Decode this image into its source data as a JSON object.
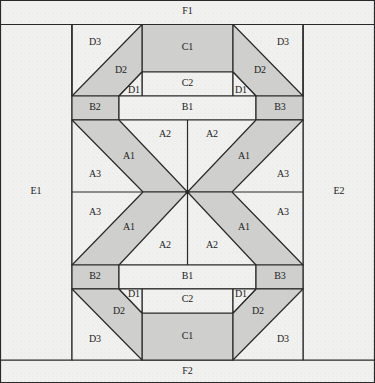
{
  "diagram": {
    "type": "quilt-block-piecing-diagram",
    "colors": {
      "light": "#f1f1ef",
      "shaded": "#cfcfcd",
      "line": "#2a2a2a"
    },
    "borders": {
      "top": "F1",
      "bottom": "F2",
      "left": "E1",
      "right": "E2"
    },
    "labels": {
      "F1": "F1",
      "F2": "F2",
      "E1": "E1",
      "E2": "E2",
      "C1": "C1",
      "C2": "C2",
      "B1": "B1",
      "B2": "B2",
      "B3": "B3",
      "D1": "D1",
      "D2": "D2",
      "D3": "D3",
      "A1": "A1",
      "A2": "A2",
      "A3": "A3"
    }
  }
}
